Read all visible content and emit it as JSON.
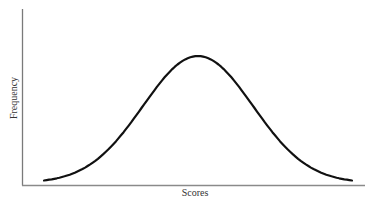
{
  "chart_data": {
    "type": "line",
    "title": "",
    "xlabel": "Scores",
    "ylabel": "Frequency",
    "grid": false,
    "legend": null,
    "xlim": [
      -3.6,
      3.0
    ],
    "ylim": [
      0,
      1.0
    ],
    "x": [
      -2.8,
      -2.4,
      -2.0,
      -1.6,
      -1.2,
      -0.8,
      -0.4,
      0.0,
      0.4,
      0.8,
      1.2,
      1.6,
      2.0,
      2.4,
      2.8
    ],
    "series": [
      {
        "name": "Frequency",
        "values": [
          0.02,
          0.056,
          0.135,
          0.278,
          0.487,
          0.726,
          0.923,
          1.0,
          0.923,
          0.726,
          0.487,
          0.278,
          0.135,
          0.056,
          0.02
        ]
      }
    ],
    "colors": {
      "curve": "#111111",
      "axes": "#888888"
    }
  }
}
